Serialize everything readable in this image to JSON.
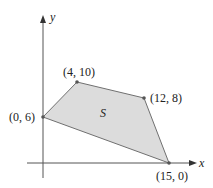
{
  "figure": {
    "axes": {
      "x_label": "x",
      "y_label": "y"
    },
    "region_label": "S",
    "vertices": [
      {
        "label": "(0, 6)",
        "x": 0,
        "y": 6
      },
      {
        "label": "(4, 10)",
        "x": 4,
        "y": 10
      },
      {
        "label": "(12, 8)",
        "x": 12,
        "y": 8
      },
      {
        "label": "(15, 0)",
        "x": 15,
        "y": 0
      }
    ],
    "colors": {
      "fill": "#dcdcdc",
      "edge": "#707070",
      "axis": "#555555",
      "vertex": "#555555"
    }
  }
}
